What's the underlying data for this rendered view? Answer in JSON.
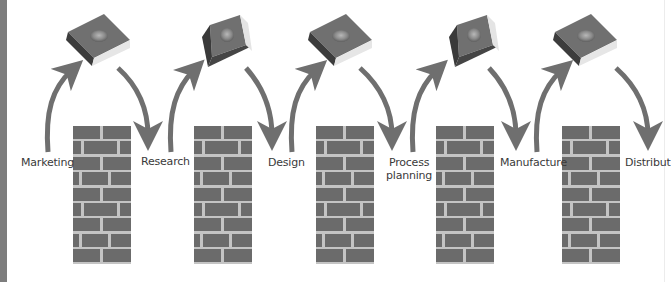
{
  "diagram": {
    "type": "process-flow",
    "colors": {
      "brick": "#6b6b6b",
      "mortar": "#c4c4c4",
      "arrow": "#6f6f6f",
      "chip_top": "#707070",
      "chip_dark_side": "#3c3c3c",
      "chip_light_side": "#e6e6e6",
      "label_text": "#3a3a3a",
      "left_bar": "#7d7d7d"
    },
    "stages": [
      {
        "label": "Marketing"
      },
      {
        "label": "Research"
      },
      {
        "label": "Design"
      },
      {
        "label": "Process\nplanning",
        "line1": "Process",
        "line2": "planning"
      },
      {
        "label": "Manufacture"
      },
      {
        "label": "Distribut"
      }
    ],
    "walls": [
      {
        "index": 1,
        "rows": 9
      },
      {
        "index": 2,
        "rows": 9
      },
      {
        "index": 3,
        "rows": 9
      },
      {
        "index": 4,
        "rows": 9
      },
      {
        "index": 5,
        "rows": 9
      }
    ],
    "chip_icon": "cutting-insert-icon",
    "arrow_icon": "curved-arrow-icon"
  }
}
